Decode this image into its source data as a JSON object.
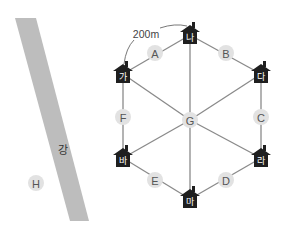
{
  "diagram": {
    "distance_label": "200m",
    "river_label": "강",
    "houses": [
      {
        "id": "na",
        "label": "나"
      },
      {
        "id": "da",
        "label": "다"
      },
      {
        "id": "ra",
        "label": "라"
      },
      {
        "id": "ma",
        "label": "마"
      },
      {
        "id": "ba",
        "label": "바"
      },
      {
        "id": "ga",
        "label": "가"
      }
    ],
    "points": [
      {
        "id": "A",
        "label": "A"
      },
      {
        "id": "B",
        "label": "B"
      },
      {
        "id": "C",
        "label": "C"
      },
      {
        "id": "D",
        "label": "D"
      },
      {
        "id": "E",
        "label": "E"
      },
      {
        "id": "F",
        "label": "F"
      },
      {
        "id": "G",
        "label": "G"
      },
      {
        "id": "H",
        "label": "H"
      }
    ],
    "edges": [
      [
        "ga",
        "na"
      ],
      [
        "na",
        "da"
      ],
      [
        "da",
        "ra"
      ],
      [
        "ra",
        "ma"
      ],
      [
        "ma",
        "ba"
      ],
      [
        "ba",
        "ga"
      ],
      [
        "G",
        "ga"
      ],
      [
        "G",
        "na"
      ],
      [
        "G",
        "da"
      ],
      [
        "G",
        "ra"
      ],
      [
        "G",
        "ma"
      ],
      [
        "G",
        "ba"
      ]
    ],
    "colors": {
      "house": "#1f1f1f",
      "node": "#e2e2e2",
      "edge": "#8a8a8a",
      "river": "#bdbdbd"
    }
  }
}
